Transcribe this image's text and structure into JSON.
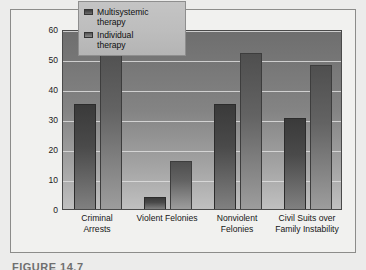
{
  "figure": {
    "caption": "FIGURE 14.7"
  },
  "chart_data": {
    "type": "bar",
    "title": "",
    "xlabel": "",
    "ylabel": "Percentage of Participants",
    "ylim": [
      0,
      60
    ],
    "ytick_step": 10,
    "ytick_labels": [
      "0",
      "10",
      "20",
      "30",
      "40",
      "50",
      "60"
    ],
    "grid": true,
    "legend_position": "top-center",
    "categories": [
      "Criminal\nArrests",
      "Violent Felonies",
      "Nonviolent\nFelonies",
      "Civil Suits over\nFamily Instability"
    ],
    "category_lines": [
      [
        "Criminal",
        "Arrests"
      ],
      [
        "Violent Felonies",
        ""
      ],
      [
        "Nonviolent",
        "Felonies"
      ],
      [
        "Civil Suits over",
        "Family Instability"
      ]
    ],
    "series": [
      {
        "name": "Multisystemic therapy",
        "color": "#3f3f3f",
        "values": [
          35,
          4,
          35,
          30.5
        ]
      },
      {
        "name": "Individual therapy",
        "color": "#6b6b6b",
        "values": [
          55,
          16,
          52,
          48
        ]
      }
    ]
  },
  "colors": {
    "plot_background_top": "#6e6e6e",
    "plot_background_bottom": "#c0c0c0",
    "gridline": "#dedede",
    "frame": "#8c8c8a",
    "page_background": "#ececeb"
  }
}
